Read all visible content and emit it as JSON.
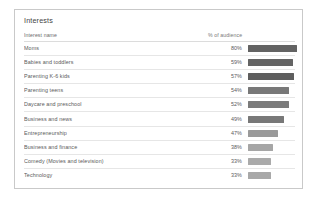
{
  "card": {
    "title": "Interests",
    "columns": {
      "name": "Interest name",
      "value": "% of audience"
    }
  },
  "chart_data": {
    "type": "bar",
    "title": "Interests",
    "xlabel": "% of audience",
    "ylabel": "Interest name",
    "orientation": "horizontal",
    "xlim": [
      0,
      100
    ],
    "grid": false,
    "legend": null,
    "categories": [
      "Moms",
      "Babies and toddlers",
      "Parenting K-6 kids",
      "Parenting teens",
      "Daycare and preschool",
      "Business and news",
      "Entrepreneurship",
      "Business and finance",
      "Comedy (Movies and television)",
      "Technology"
    ],
    "values": [
      80,
      59,
      57,
      54,
      52,
      49,
      47,
      38,
      33,
      33
    ],
    "value_labels": [
      "80%",
      "59%",
      "57%",
      "54%",
      "52%",
      "49%",
      "47%",
      "38%",
      "33%",
      "33%"
    ],
    "bar_colors": [
      "#636363",
      "#646464",
      "#5e5e5e",
      "#787878",
      "#7b7b7b",
      "#787878",
      "#9a9a9a",
      "#a6a6a6",
      "#aaaaaa",
      "#a8a8a8"
    ],
    "bar_widths_px": [
      49,
      45,
      46,
      41,
      41,
      36,
      30,
      25,
      23,
      23
    ]
  },
  "rows": [
    {
      "name": "Moms",
      "value": "80%",
      "bar_width": 49,
      "color": "#636363"
    },
    {
      "name": "Babies and toddlers",
      "value": "59%",
      "bar_width": 45,
      "color": "#646464"
    },
    {
      "name": "Parenting K-6 kids",
      "value": "57%",
      "bar_width": 46,
      "color": "#5e5e5e"
    },
    {
      "name": "Parenting teens",
      "value": "54%",
      "bar_width": 41,
      "color": "#787878"
    },
    {
      "name": "Daycare and preschool",
      "value": "52%",
      "bar_width": 41,
      "color": "#7b7b7b"
    },
    {
      "name": "Business and news",
      "value": "49%",
      "bar_width": 36,
      "color": "#787878"
    },
    {
      "name": "Entrepreneurship",
      "value": "47%",
      "bar_width": 30,
      "color": "#9a9a9a"
    },
    {
      "name": "Business and finance",
      "value": "38%",
      "bar_width": 25,
      "color": "#a6a6a6"
    },
    {
      "name": "Comedy (Movies and television)",
      "value": "33%",
      "bar_width": 23,
      "color": "#aaaaaa"
    },
    {
      "name": "Technology",
      "value": "33%",
      "bar_width": 23,
      "color": "#a8a8a8"
    }
  ]
}
